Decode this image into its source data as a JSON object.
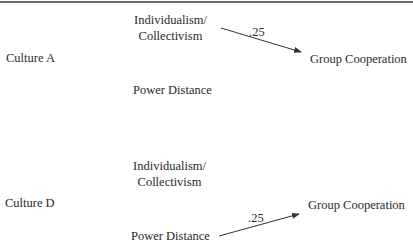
{
  "panels": [
    {
      "culture": "Culture A",
      "node_top": "Individualism/",
      "node_top2": "Collectivism",
      "node_bottom": "Power Distance",
      "outcome": "Group Cooperation",
      "path_coefficient": ".25",
      "path_from": "Individualism/Collectivism"
    },
    {
      "culture": "Culture D",
      "node_top": "Individualism/",
      "node_top2": "Collectivism",
      "node_bottom": "Power Distance",
      "outcome": "Group Cooperation",
      "path_coefficient": ".25",
      "path_from": "Power Distance"
    }
  ],
  "colors": {
    "text": "#2a2a2a",
    "rule": "#6b6b6b",
    "arrow": "#333333"
  }
}
